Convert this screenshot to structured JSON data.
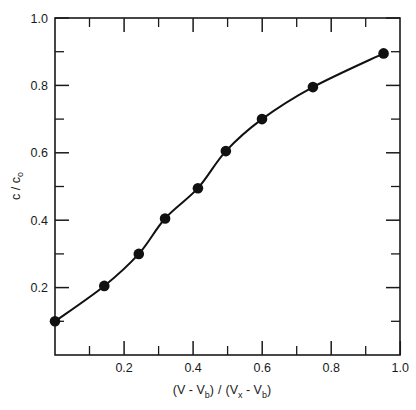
{
  "chart_data": {
    "type": "scatter",
    "title": "",
    "subtitle": "",
    "xlabel": "(V - Vb) / (Vx - Vb)",
    "ylabel": "c / co",
    "xlabel_parts": {
      "open1": "(V - V",
      "sub1": "b",
      "close1": ")",
      "slash": "/",
      "open2": "(V",
      "sub2": "x",
      "mid": " - V",
      "sub3": "b",
      "close2": ")"
    },
    "ylabel_parts": {
      "main": "c / c",
      "sub": "o"
    },
    "xlim": [
      0,
      1.05
    ],
    "ylim": [
      0,
      1.0
    ],
    "grid": false,
    "legend": null,
    "legend_position": "none",
    "xticks": [
      0.2,
      0.4,
      0.6,
      0.8,
      1.0
    ],
    "xtick_labels": [
      "0.2",
      "0.4",
      "0.6",
      "0.8",
      "1.0"
    ],
    "xminor_ticks": [
      0.1,
      0.3,
      0.5,
      0.7,
      0.9
    ],
    "yticks": [
      0.2,
      0.4,
      0.6,
      0.8,
      1.0
    ],
    "ytick_labels": [
      "0.2",
      "0.4",
      "0.6",
      "0.8",
      "1.0"
    ],
    "yminor_ticks": [
      0.1,
      0.3,
      0.5,
      0.7,
      0.9
    ],
    "tick_direction": "in",
    "marker_style": "filled-circle",
    "marker_color": "#111111",
    "line_color": "#111111",
    "x": [
      0.0,
      0.15,
      0.255,
      0.335,
      0.435,
      0.52,
      0.63,
      0.785,
      1.0
    ],
    "y": [
      0.1,
      0.205,
      0.3,
      0.405,
      0.495,
      0.605,
      0.7,
      0.795,
      0.895
    ],
    "series": [
      {
        "name": "measured",
        "points": [
          {
            "x": 0.0,
            "y": 0.1
          },
          {
            "x": 0.15,
            "y": 0.205
          },
          {
            "x": 0.255,
            "y": 0.3
          },
          {
            "x": 0.335,
            "y": 0.405
          },
          {
            "x": 0.435,
            "y": 0.495
          },
          {
            "x": 0.52,
            "y": 0.605
          },
          {
            "x": 0.63,
            "y": 0.7
          },
          {
            "x": 0.785,
            "y": 0.795
          },
          {
            "x": 1.0,
            "y": 0.895
          }
        ]
      }
    ]
  }
}
